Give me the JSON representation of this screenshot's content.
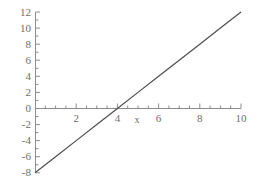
{
  "chart_data": {
    "type": "line",
    "title": "",
    "subtitle": "",
    "xlabel": "x",
    "ylabel": "",
    "xlim": [
      0,
      10
    ],
    "ylim": [
      -8,
      12
    ],
    "grid": false,
    "legend": false,
    "legend_position": "none",
    "equation": "y = 2x - 8",
    "slope": 2,
    "intercept": -8,
    "x_root": 4,
    "series": [
      {
        "name": "y = 2x - 8",
        "color": "#4d4d4d",
        "x": [
          0,
          1,
          2,
          3,
          4,
          5,
          6,
          7,
          8,
          9,
          10
        ],
        "values": [
          -8,
          -6,
          -4,
          -2,
          0,
          2,
          4,
          6,
          8,
          10,
          12
        ]
      }
    ],
    "x_ticks": [
      0,
      2,
      4,
      6,
      8,
      10
    ],
    "x_tick_labels": [
      "",
      "2",
      "4",
      "6",
      "8",
      "10"
    ],
    "x_minor_step": 0.5,
    "y_ticks": [
      -8,
      -6,
      -4,
      -2,
      0,
      2,
      4,
      6,
      8,
      10,
      12
    ],
    "y_tick_labels": [
      "-8",
      "-6",
      "-4",
      "-2",
      "0",
      "2",
      "4",
      "6",
      "8",
      "10",
      "12"
    ],
    "y_minor_step": 0.5,
    "axis_color": "#8c8c8c",
    "text_color": "#6d6d6d",
    "background_color": "#ffffff"
  },
  "axes": {
    "x_axis_label": "x",
    "y_axis_label": ""
  },
  "ticks": {
    "x": {
      "t0": "",
      "t2": "2",
      "t4": "4",
      "t6": "6",
      "t8": "8",
      "t10": "10"
    },
    "y": {
      "tm8": "-8",
      "tm6": "-6",
      "tm4": "-4",
      "tm2": "-2",
      "t0": "0",
      "t2": "2",
      "t4": "4",
      "t6": "6",
      "t8": "8",
      "t10": "10",
      "t12": "12"
    }
  }
}
